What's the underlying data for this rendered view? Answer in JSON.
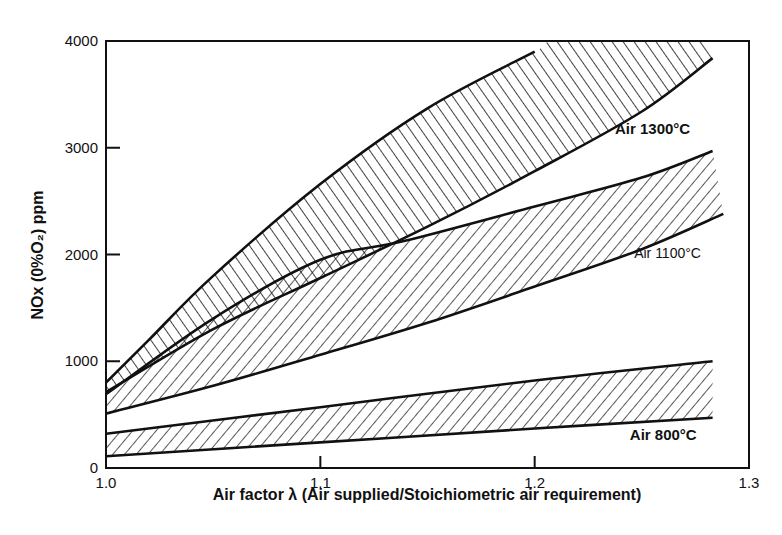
{
  "chart_data": {
    "type": "area",
    "title": "",
    "xlabel": "Air factor λ (Air supplied/Stoichiometric air requirement)",
    "ylabel": "NOx (0%O₂) ppm",
    "xlim": [
      1.0,
      1.3
    ],
    "ylim": [
      0,
      4000
    ],
    "x_ticks": [
      1.0,
      1.1,
      1.2,
      1.3
    ],
    "x_tick_labels": [
      "1.0",
      "1.1",
      "1.2",
      "1.3"
    ],
    "y_ticks": [
      0,
      1000,
      2000,
      3000,
      4000
    ],
    "y_tick_labels": [
      "0",
      "1000",
      "2000",
      "3000",
      "4000"
    ],
    "grid": false,
    "legend": "inline labels at right end of each band",
    "series": [
      {
        "name": "Air 1300°C",
        "hatch": "backslash",
        "x": [
          1.0,
          1.02,
          1.05,
          1.1,
          1.15,
          1.2,
          1.213,
          1.28
        ],
        "upper": [
          800,
          1200,
          1800,
          2660,
          3370,
          3900,
          4000,
          4000
        ],
        "x_lower": [
          1.0,
          1.05,
          1.1,
          1.15,
          1.2,
          1.25,
          1.283
        ],
        "lower": [
          710,
          1300,
          1780,
          2260,
          2780,
          3340,
          3840
        ]
      },
      {
        "name": "Air 1100°C",
        "hatch": "slash",
        "x": [
          1.0,
          1.05,
          1.1,
          1.14,
          1.2,
          1.25,
          1.283
        ],
        "upper": [
          690,
          1400,
          1950,
          2130,
          2450,
          2720,
          2970
        ],
        "x_lower": [
          1.0,
          1.05,
          1.1,
          1.15,
          1.2,
          1.25,
          1.288
        ],
        "lower": [
          510,
          770,
          1060,
          1360,
          1700,
          2050,
          2380
        ]
      },
      {
        "name": "Air 800°C",
        "hatch": "slash",
        "x": [
          1.0,
          1.1,
          1.2,
          1.283
        ],
        "upper": [
          320,
          570,
          820,
          1000
        ],
        "x_lower": [
          1.0,
          1.1,
          1.2,
          1.283
        ],
        "lower": [
          110,
          240,
          370,
          470
        ]
      }
    ],
    "annotations": [
      {
        "text": "Air 1300°C",
        "x": 1.255,
        "y": 3130,
        "bold": true
      },
      {
        "text": "Air 1100°C",
        "x": 1.262,
        "y": 1970,
        "bold": false
      },
      {
        "text": "Air 800°C",
        "x": 1.26,
        "y": 260,
        "bold": true
      }
    ],
    "overlap_region": {
      "description": "cross-hatched where Air 1300°C and Air 1100°C bands overlap",
      "x_range": [
        1.0,
        1.14
      ]
    }
  },
  "layout": {
    "plot": {
      "left": 106,
      "right": 749,
      "top": 41,
      "bottom": 468
    }
  }
}
